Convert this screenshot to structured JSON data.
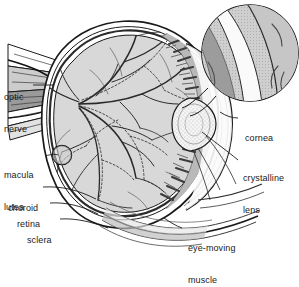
{
  "figure": {
    "type": "anatomical-diagram",
    "background_color": "#ffffff",
    "ink_color": "#1a1a1a",
    "vitreous_fill": "#d8d8d8",
    "sclera_fill": "#ffffff",
    "lens_fill": "#f2f2f2",
    "ciliary_fill": "#8f8f8f",
    "inset_fill": "#c9c9c9"
  },
  "labels": {
    "optic_nerve": {
      "line1": "optic",
      "line2": "nerve"
    },
    "macula_lutea": {
      "line1": "macula",
      "line2": "lutea"
    },
    "choroid": {
      "line1": "choroid"
    },
    "retina": {
      "line1": "retina"
    },
    "sclera": {
      "line1": "sclera"
    },
    "cornea": {
      "line1": "cornea"
    },
    "crystalline_lens": {
      "line1": "crystalline",
      "line2": "lens"
    },
    "eye_moving_muscle": {
      "line1": "eye-moving",
      "line2": "muscle"
    }
  },
  "structures": [
    {
      "name": "optic-nerve",
      "side": "left"
    },
    {
      "name": "macula-lutea",
      "side": "left"
    },
    {
      "name": "choroid",
      "side": "left"
    },
    {
      "name": "retina",
      "side": "left"
    },
    {
      "name": "sclera",
      "side": "left"
    },
    {
      "name": "cornea",
      "side": "right"
    },
    {
      "name": "crystalline-lens",
      "side": "right"
    },
    {
      "name": "eye-moving-muscle",
      "side": "right"
    },
    {
      "name": "ciliary-body",
      "side": "interior"
    },
    {
      "name": "vitreous-body",
      "side": "interior"
    },
    {
      "name": "retinal-blood-vessels",
      "side": "interior"
    },
    {
      "name": "magnified-detail-inset",
      "side": "top-right"
    }
  ]
}
